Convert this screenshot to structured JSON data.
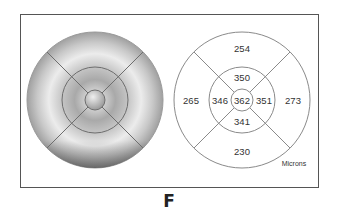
{
  "figure": {
    "panel_label": "F",
    "units_label": "Microns",
    "colors": {
      "frame": "#555555",
      "grid": "#8a8a8a",
      "text": "#333333",
      "map_light": "#e6e6e6",
      "map_dark": "#8c8c8c"
    }
  },
  "thickness_map": {
    "description": "grayscale retinal thickness map with ETDRS grid overlay"
  },
  "etdrs_grid": {
    "center": "362",
    "inner": {
      "superior": "350",
      "nasal": "351",
      "inferior": "341",
      "temporal": "346"
    },
    "outer": {
      "superior": "254",
      "nasal": "273",
      "inferior": "230",
      "temporal": "265"
    }
  }
}
